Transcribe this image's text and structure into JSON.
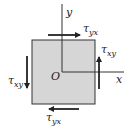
{
  "diagram": {
    "element": {
      "fill": "#d6d6d6",
      "stroke": "#333333"
    },
    "axes": {
      "x_label": "x",
      "y_label": "y",
      "origin_label": "O",
      "color": "#333333"
    },
    "labels": {
      "top": {
        "symbol": "τ",
        "subscript": "yx"
      },
      "right": {
        "symbol": "τ",
        "subscript": "xy"
      },
      "left": {
        "symbol": "τ",
        "subscript": "xy"
      },
      "bottom": {
        "symbol": "τ",
        "subscript": "yx"
      }
    },
    "arrows": [
      {
        "side": "top",
        "direction": "right"
      },
      {
        "side": "right",
        "direction": "up"
      },
      {
        "side": "left",
        "direction": "down"
      },
      {
        "side": "bottom",
        "direction": "left"
      }
    ],
    "arrow_color": "#222222"
  }
}
